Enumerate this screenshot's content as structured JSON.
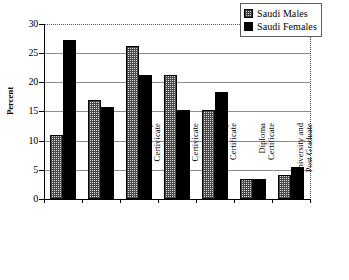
{
  "chart_data": {
    "type": "bar",
    "title": "",
    "xlabel": "",
    "ylabel": "Percent",
    "ylim": [
      0,
      30
    ],
    "yticks": [
      0,
      5,
      10,
      15,
      20,
      25,
      30
    ],
    "grid": true,
    "legend_position": "top-right",
    "categories": [
      "Illiterate",
      "Read and Write",
      "Primary\nCertivicate",
      "Intermediate\nCertivicate",
      "Secondary\nCertificate",
      "Diploma\nCertificate",
      "University and\nPost Graduate"
    ],
    "series": [
      {
        "name": "Saudi Males",
        "fill": "checkered-light",
        "color": "#d6d6d6",
        "values": [
          11.0,
          17.0,
          26.2,
          21.2,
          15.2,
          3.4,
          4.2
        ]
      },
      {
        "name": "Saudi Females",
        "fill": "solid-black",
        "color": "#000000",
        "values": [
          27.2,
          15.8,
          21.2,
          15.2,
          18.3,
          3.4,
          5.5
        ]
      }
    ]
  },
  "legend": {
    "items": [
      {
        "label": "Saudi Males",
        "swatch": "checkered-swatch-icon"
      },
      {
        "label": "Saudi Females",
        "swatch": "solid-swatch-icon"
      }
    ]
  },
  "axes": {
    "y_label": "Percent",
    "y_ticks": [
      "30",
      "25",
      "20",
      "15",
      "10",
      "5",
      "0"
    ]
  }
}
